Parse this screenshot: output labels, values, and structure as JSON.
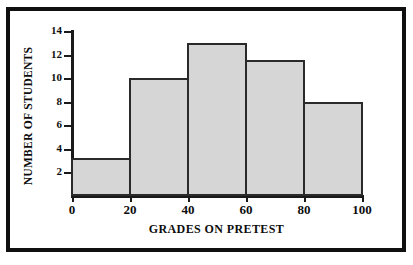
{
  "chart_data": {
    "type": "bar",
    "title": "",
    "subtitle": "",
    "xlabel": "GRADES ON PRETEST",
    "ylabel": "NUMBER OF STUDENTS",
    "xlim": [
      0,
      100
    ],
    "ylim": [
      0,
      14
    ],
    "grid": false,
    "legend": false,
    "bin_width": 20,
    "bin_edges": [
      0,
      20,
      40,
      60,
      80,
      100
    ],
    "categories": [
      "0-20",
      "20-40",
      "40-60",
      "60-80",
      "80-100"
    ],
    "values": [
      3.2,
      10,
      13,
      11.5,
      8
    ],
    "xticks": [
      0,
      20,
      40,
      60,
      80,
      100
    ],
    "xtick_labels": [
      "0",
      "20",
      "40",
      "60",
      "80",
      "100"
    ],
    "yticks": [
      2,
      4,
      6,
      8,
      10,
      12,
      14
    ],
    "ytick_labels": [
      "2",
      "4",
      "6",
      "8",
      "10",
      "12",
      "14"
    ],
    "colors": {
      "bar_fill": "#d6d6d6",
      "bar_edge": "#2a2a2a",
      "axis": "#1a1a1a",
      "text": "#0d0d0d",
      "background": "#ffffff",
      "frame": "#101010"
    }
  }
}
